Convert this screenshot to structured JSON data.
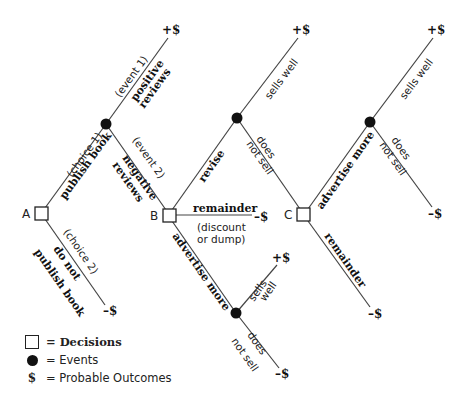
{
  "diagram": {
    "type": "decision-tree",
    "nodes": {
      "A": {
        "label": "A",
        "kind": "decision"
      },
      "B": {
        "label": "B",
        "kind": "decision"
      },
      "C": {
        "label": "C",
        "kind": "decision"
      }
    },
    "branches": {
      "choice1_tag": "(choice 1)",
      "choice1_label": "publish book",
      "choice2_tag": "(choice 2)",
      "choice2_label_1": "do not",
      "choice2_label_2": "publish book",
      "event1_tag": "(event 1)",
      "event1_label_1": "positive",
      "event1_label_2": "reviews",
      "event2_tag": "(event 2)",
      "event2_label_1": "negative",
      "event2_label_2": "reviews",
      "revise": "revise",
      "remainder_B": "remainder",
      "remainder_B_note_1": "(discount",
      "remainder_B_note_2": "or dump)",
      "advertise_B": "advertise more",
      "sells_well_1": "sells well",
      "does_not_sell_1a": "does",
      "does_not_sell_1b": "not sell",
      "advertise_C": "advertise more",
      "remainder_C": "remainder",
      "sells_well_2": "sells well",
      "does_not_sell_2a": "does",
      "does_not_sell_2b": "not sell",
      "sells_well_3a": "sells",
      "sells_well_3b": "well",
      "does_not_sell_3a": "does",
      "does_not_sell_3b": "not sell"
    },
    "outcomes": {
      "positive_reviews": "+$",
      "revise_sells_well": "+$",
      "advertise_C_sells_well": "+$",
      "advertise_C_does_not_sell": "–$",
      "remainder_C": "–$",
      "remainder_B": "–$",
      "advertise_B_sells_well": "+$",
      "advertise_B_does_not_sell": "–$",
      "do_not_publish": "–$"
    }
  },
  "legend": {
    "decisions": "= Decisions",
    "events": "= Events",
    "dollar_symbol": "$",
    "outcomes": "= Probable Outcomes"
  }
}
